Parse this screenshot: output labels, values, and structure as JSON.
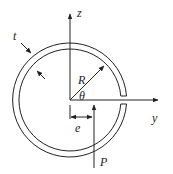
{
  "diagram": {
    "labels": {
      "z_axis": "z",
      "y_axis": "y",
      "radius": "R",
      "angle": "θ",
      "thickness": "t",
      "eccentricity": "e",
      "load": "P"
    },
    "colors": {
      "stroke": "#222222",
      "background": "#ffffff"
    },
    "geometry": {
      "center": [
        70,
        100
      ],
      "outer_radius": 57,
      "inner_radius": 51,
      "slit_at": "positive y-axis"
    }
  }
}
